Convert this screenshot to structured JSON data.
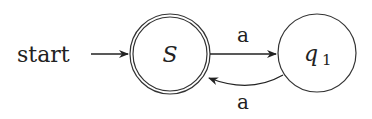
{
  "diagram": {
    "type": "finite-automaton",
    "start_label": "start",
    "states": [
      {
        "id": "S",
        "label": "S",
        "accepting": true,
        "initial": true
      },
      {
        "id": "q1",
        "label": "q",
        "subscript": "1",
        "accepting": false
      }
    ],
    "transitions": [
      {
        "from": "S",
        "to": "q1",
        "label": "a"
      },
      {
        "from": "q1",
        "to": "S",
        "label": "a"
      }
    ],
    "colors": {
      "stroke": "#222222",
      "background": "#ffffff"
    }
  }
}
